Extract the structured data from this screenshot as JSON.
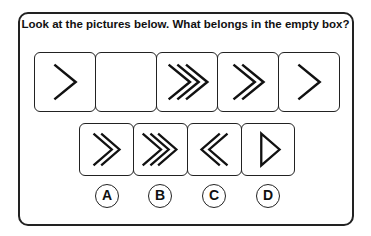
{
  "question": "Look at the pictures below. What belongs in the empty box?",
  "sequence": [
    {
      "id": "seq-1",
      "icon": "single-chevron-right-icon",
      "chevrons": 1,
      "direction": "right"
    },
    {
      "id": "seq-2",
      "icon": "empty",
      "chevrons": 0,
      "direction": "none"
    },
    {
      "id": "seq-3",
      "icon": "triple-chevron-right-icon",
      "chevrons": 3,
      "direction": "right"
    },
    {
      "id": "seq-4",
      "icon": "double-chevron-right-icon",
      "chevrons": 2,
      "direction": "right"
    },
    {
      "id": "seq-5",
      "icon": "single-chevron-right-icon",
      "chevrons": 1,
      "direction": "right"
    }
  ],
  "options": [
    {
      "label": "A",
      "icon": "double-chevron-right-icon"
    },
    {
      "label": "B",
      "icon": "triple-chevron-right-icon"
    },
    {
      "label": "C",
      "icon": "double-chevron-left-icon"
    },
    {
      "label": "D",
      "icon": "triangle-right-icon"
    }
  ]
}
